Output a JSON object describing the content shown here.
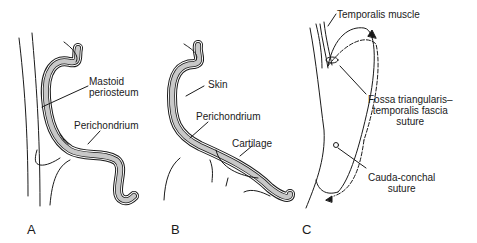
{
  "panels": [
    {
      "letter": "A",
      "labels": {
        "mastoid_line1": "Mastoid",
        "mastoid_line2": "periosteum",
        "perichondrium": "Perichondrium"
      }
    },
    {
      "letter": "B",
      "labels": {
        "skin": "Skin",
        "perichondrium": "Perichondrium",
        "cartilage": "Cartilage"
      }
    },
    {
      "letter": "C",
      "labels": {
        "temporalis": "Temporalis muscle",
        "fossa_line1": "Fossa triangularis–",
        "fossa_line2": "temporalis fascia",
        "fossa_line3": "suture",
        "cauda_line1": "Cauda-conchal",
        "cauda_line2": "suture"
      }
    }
  ],
  "colors": {
    "cartilage_fill": "#c8c8c8",
    "line": "#1a1a1a"
  }
}
